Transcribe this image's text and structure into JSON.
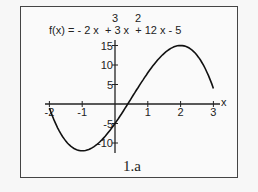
{
  "chart_data": {
    "type": "line",
    "title_parts": {
      "base": "f(x) = - 2 x  + 3 x  + 12 x - 5",
      "exp1": "3",
      "exp2": "2"
    },
    "caption": "1.a",
    "xlabel": "x",
    "ylabel": "",
    "xlim": [
      -2,
      3
    ],
    "ylim": [
      -12,
      16
    ],
    "x_ticks": [
      "-2",
      "-1",
      "1",
      "2",
      "3"
    ],
    "y_ticks": [
      "15",
      "10",
      "5",
      "-5",
      "-10"
    ],
    "grid": false,
    "series": [
      {
        "name": "f(x)",
        "x": [
          -2,
          -1.5,
          -1,
          -0.5,
          0,
          0.5,
          1,
          1.5,
          2,
          2.5,
          3
        ],
        "values": [
          -1,
          -9.5,
          -12,
          -9.5,
          -5,
          1.5,
          8,
          13,
          15,
          12.5,
          4
        ]
      }
    ]
  }
}
